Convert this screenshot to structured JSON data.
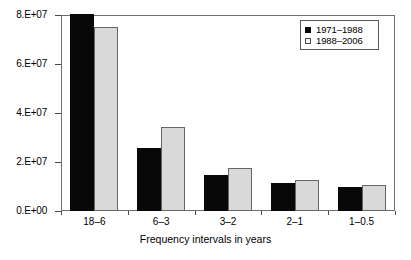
{
  "chart_data": {
    "type": "bar",
    "title": "",
    "subtitle": "",
    "xlabel": "Frequency intervals in years",
    "ylabel": "",
    "categories": [
      "18–6",
      "6–3",
      "3–2",
      "2–1",
      "1–0.5"
    ],
    "series": [
      {
        "name": "1971–1988",
        "color": "#080808",
        "values": [
          80000000,
          25800000,
          14700000,
          11500000,
          9800000
        ],
        "clipped": [
          true,
          false,
          false,
          false,
          false
        ]
      },
      {
        "name": "1988–2006",
        "color": "#d9d9d9",
        "values": [
          75000000,
          34400000,
          17600000,
          12700000,
          10600000
        ],
        "clipped": [
          false,
          false,
          false,
          false,
          false
        ]
      }
    ],
    "ylim": [
      0,
      80000000
    ],
    "yticks": [
      0,
      20000000,
      40000000,
      60000000,
      80000000
    ],
    "ytick_labels": [
      "0.E+00",
      "2.E+07",
      "4.E+07",
      "6.E+07",
      "8.E+07"
    ],
    "grid": false,
    "legend_position": "top-right",
    "note": "First black bar is clipped by the axis maximum of 8.E+07"
  },
  "axes": {
    "y_ticks": [
      {
        "label": "8.E+07",
        "value": 80000000
      },
      {
        "label": "6.E+07",
        "value": 60000000
      },
      {
        "label": "4.E+07",
        "value": 40000000
      },
      {
        "label": "2.E+07",
        "value": 20000000
      },
      {
        "label": "0.E+00",
        "value": 0
      }
    ],
    "x_ticks": [
      {
        "label": "18–6"
      },
      {
        "label": "6–3"
      },
      {
        "label": "3–2"
      },
      {
        "label": "2–1"
      },
      {
        "label": "1–0.5"
      }
    ],
    "x_title": "Frequency intervals in years"
  },
  "legend": {
    "entries": [
      {
        "label": "1971–1988",
        "swatch": "filled-black-square"
      },
      {
        "label": "1988–2006",
        "swatch": "open-light-square"
      }
    ]
  }
}
